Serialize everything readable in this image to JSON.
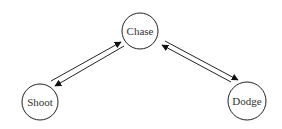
{
  "diagram": {
    "type": "state-transition",
    "nodes": [
      {
        "id": "chase",
        "label": "Chase",
        "cx": 140,
        "cy": 31,
        "r": 18
      },
      {
        "id": "shoot",
        "label": "Shoot",
        "cx": 40,
        "cy": 102,
        "r": 18
      },
      {
        "id": "dodge",
        "label": "Dodge",
        "cx": 247,
        "cy": 101,
        "r": 19
      }
    ],
    "edges": [
      {
        "from": "Shoot",
        "to": "Chase"
      },
      {
        "from": "Chase",
        "to": "Shoot"
      },
      {
        "from": "Dodge",
        "to": "Chase"
      },
      {
        "from": "Chase",
        "to": "Dodge"
      }
    ]
  }
}
